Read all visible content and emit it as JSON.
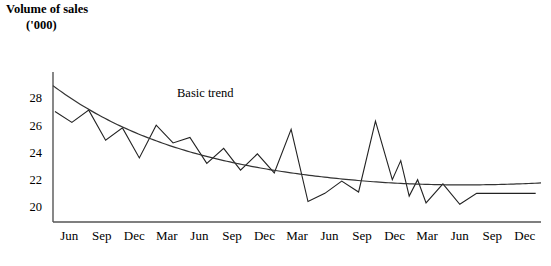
{
  "chart_data": {
    "type": "line",
    "title": "Volume of sales",
    "title_line1": "Volume of sales",
    "title_line2": "('000)",
    "ylabel": "Volume of sales ('000)",
    "xlabel": "",
    "grid": false,
    "legend": "none",
    "ylim": [
      19,
      30
    ],
    "yticks": [
      20,
      22,
      24,
      26,
      28
    ],
    "ytick_labels": [
      "28",
      "26",
      "24",
      "22",
      "20"
    ],
    "categories": [
      "Jun",
      "Sep",
      "Dec",
      "Mar",
      "Jun",
      "Sep",
      "Dec",
      "Mar",
      "Jun",
      "Sep",
      "Dec",
      "Mar",
      "Jun",
      "Sep",
      "Dec"
    ],
    "annotations": [
      {
        "text": "Basic trend",
        "x": "Jun",
        "y": 27.6
      }
    ],
    "series": [
      {
        "name": "Volume of sales",
        "style": "sawtooth",
        "color": "#222222",
        "x": [
          0,
          0.5,
          1,
          1.5,
          2,
          2.5,
          3,
          3.5,
          4,
          4.5,
          5,
          5.5,
          6,
          6.5,
          7,
          7.5,
          8,
          8.5,
          9,
          9.5,
          10,
          10.25,
          10.5,
          10.75,
          11,
          11.5,
          12,
          12.5,
          12.75,
          13,
          13.25,
          13.5,
          13.75,
          14,
          14.25
        ],
        "values": [
          27.1,
          26.3,
          27.2,
          25.0,
          25.9,
          23.7,
          26.1,
          24.8,
          25.2,
          23.3,
          24.4,
          22.8,
          24.0,
          22.6,
          25.8,
          20.5,
          21.1,
          22.0,
          21.2,
          26.4,
          22.1,
          23.5,
          20.9,
          22.1,
          20.4,
          21.8,
          20.3,
          21.1,
          21.1,
          21.1,
          21.1,
          21.1,
          21.1,
          21.1,
          21.1
        ]
      },
      {
        "name": "Basic trend",
        "style": "smooth-curve",
        "color": "#333333",
        "values_start": 29.0,
        "values_min": 21.1,
        "values_end": 21.6
      }
    ]
  },
  "axes": {
    "y_axis_name": "y-axis",
    "x_axis_name": "x-axis",
    "y_tick_values": [
      "28",
      "26",
      "24",
      "22",
      "20"
    ],
    "x_tick_values": [
      "Jun",
      "Sep",
      "Dec",
      "Mar",
      "Jun",
      "Sep",
      "Dec",
      "Mar",
      "Jun",
      "Sep",
      "Dec",
      "Mar",
      "Jun",
      "Sep",
      "Dec"
    ]
  },
  "style": {
    "line_color": "#222222",
    "trend_color": "#333333",
    "axis_color": "#555555",
    "background": "#ffffff"
  }
}
